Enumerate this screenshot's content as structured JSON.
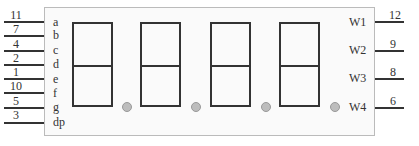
{
  "left_pins": [
    {
      "pin": "11",
      "segment": "a"
    },
    {
      "pin": "7",
      "segment": "b"
    },
    {
      "pin": "4",
      "segment": "c"
    },
    {
      "pin": "2",
      "segment": "d"
    },
    {
      "pin": "1",
      "segment": "e"
    },
    {
      "pin": "10",
      "segment": "f"
    },
    {
      "pin": "5",
      "segment": "g"
    },
    {
      "pin": "3",
      "segment": "dp"
    }
  ],
  "right_pins": [
    {
      "pin": "12",
      "label": "W1"
    },
    {
      "pin": "9",
      "label": "W2"
    },
    {
      "pin": "8",
      "label": "W3"
    },
    {
      "pin": "6",
      "label": "W4"
    }
  ],
  "digits": 4,
  "colors": {
    "line": "#333333",
    "dp": "#bdbdbd",
    "box_border": "#bbbbbb"
  }
}
